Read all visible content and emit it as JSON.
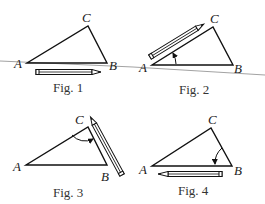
{
  "figures": [
    {
      "caption": "Fig. 1",
      "labels": {
        "A": "A",
        "B": "B",
        "C": "C"
      },
      "pencil": "along AB below triangle, tip pointing right"
    },
    {
      "caption": "Fig. 2",
      "labels": {
        "A": "A",
        "B": "B",
        "C": "C"
      },
      "pencil": "along AC, rotated counterclockwise about A"
    },
    {
      "caption": "Fig. 3",
      "labels": {
        "A": "A",
        "B": "B",
        "C": "C"
      },
      "pencil": "along CB, rotated about C"
    },
    {
      "caption": "Fig. 4",
      "labels": {
        "A": "A",
        "B": "B",
        "C": "C"
      },
      "pencil": "along BA below triangle, tip pointing left"
    }
  ],
  "colors": {
    "stroke": "#111111",
    "reference_line": "#8a8a8a",
    "background": "#ffffff"
  }
}
